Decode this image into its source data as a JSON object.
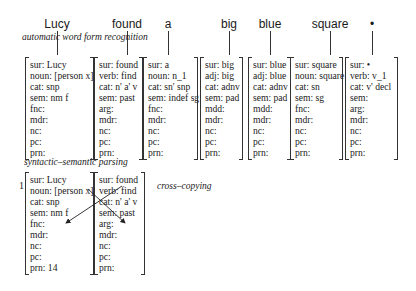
{
  "words": [
    "Lucy",
    "found",
    "a",
    "big",
    "blue",
    "square",
    "•"
  ],
  "captions": {
    "word_form": "automatic word form recognition",
    "parsing": "syntactic–semantic parsing",
    "cross_copying": "cross–copying"
  },
  "step_number": "1",
  "top_avms": [
    {
      "word": "Lucy",
      "rows": [
        "sur: Lucy",
        "noun: [person x]",
        "cat: snp",
        "sem: nm f",
        "fnc:",
        "mdr:",
        "nc:",
        "pc:",
        "prn:"
      ]
    },
    {
      "word": "found",
      "rows": [
        "sur: found",
        "verb: find",
        "cat: n' a' v",
        "sem: past",
        "arg:",
        "mdr:",
        "nc:",
        "pc:",
        "prn:"
      ]
    },
    {
      "word": "a",
      "rows": [
        "sur: a",
        "noun: n_1",
        "cat: sn' snp",
        "sem: indef sg",
        "fnc:",
        "mdr:",
        "nc:",
        "pc:",
        "prn:"
      ]
    },
    {
      "word": "big",
      "rows": [
        "sur: big",
        "adj: big",
        "cat: adnv",
        "sem: pad",
        "mdd:",
        "mdr:",
        "nc:",
        "pc:",
        "prn:"
      ]
    },
    {
      "word": "blue",
      "rows": [
        "sur: blue",
        "adj: blue",
        "cat: adnv",
        "sem: pad",
        "mdd:",
        "mdr:",
        "nc:",
        "pc:",
        "prn:"
      ]
    },
    {
      "word": "square",
      "rows": [
        "sur: square",
        "noun: square",
        "cat: sn",
        "sem: sg",
        "fnc:",
        "mdr:",
        "nc:",
        "pc:",
        "prn:"
      ]
    },
    {
      "word": "•",
      "rows": [
        "sur: •",
        "verb: v_1",
        "cat: v' decl",
        "sem:",
        "arg:",
        "mdr:",
        "nc:",
        "pc:",
        "prn:"
      ]
    }
  ],
  "bottom_avms": [
    {
      "word": "Lucy",
      "rows": [
        "sur: Lucy",
        "noun: [person x]",
        "cat: snp",
        "sem: nm f",
        "fnc:",
        "mdr:",
        "nc:",
        "pc:",
        "prn: 14"
      ]
    },
    {
      "word": "found",
      "rows": [
        "sur: found",
        "verb: find",
        "cat: n' a' v",
        "sem: past",
        "arg:",
        "mdr:",
        "nc:",
        "pc:",
        "prn:"
      ]
    }
  ]
}
